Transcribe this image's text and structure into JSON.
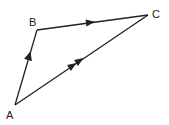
{
  "diagram": {
    "type": "vector-triangle",
    "vertices": [
      {
        "label": "A",
        "x": 15,
        "y": 105
      },
      {
        "label": "B",
        "x": 37,
        "y": 30
      },
      {
        "label": "C",
        "x": 148,
        "y": 15
      }
    ],
    "edges": [
      {
        "from": "A",
        "to": "B",
        "arrows": 1
      },
      {
        "from": "B",
        "to": "C",
        "arrows": 1
      },
      {
        "from": "A",
        "to": "C",
        "arrows": 2
      }
    ],
    "stroke_color": "#222222"
  }
}
